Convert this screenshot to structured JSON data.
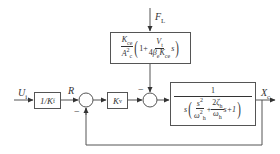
{
  "diagram": {
    "type": "control-block-diagram",
    "inputs": {
      "reference_input": {
        "symbol": "U",
        "subscript": "i"
      },
      "disturbance": {
        "symbol": "F",
        "subscript": "L"
      }
    },
    "signals": {
      "reference": "R",
      "output": {
        "symbol": "X",
        "subscript": "c"
      }
    },
    "blocks": {
      "feedback_gain": {
        "text": "1/K",
        "subscript": "f"
      },
      "valve_gain": {
        "symbol": "K",
        "subscript": "v"
      },
      "disturbance_tf": {
        "coef_num": {
          "symbol": "K",
          "subscript": "ce"
        },
        "coef_den": {
          "symbol": "A",
          "subscript": "c",
          "superscript": "2"
        },
        "one": "1",
        "plus": "+",
        "inner_num": {
          "symbol": "V",
          "subscript": "t"
        },
        "inner_den": {
          "prefix": "4",
          "beta": "β",
          "beta_sub": "e",
          "k": "K",
          "k_sub": "ce"
        },
        "s": "s"
      },
      "plant_tf": {
        "numerator": "1",
        "s": "s",
        "term1_num": {
          "symbol": "s",
          "superscript": "2"
        },
        "term1_den": {
          "symbol": "ω",
          "subscript": "h",
          "superscript": "2"
        },
        "plus": "+",
        "term2_num": {
          "prefix": "2",
          "symbol": "ζ",
          "subscript": "h"
        },
        "term2_den": {
          "symbol": "ω",
          "subscript": "h"
        },
        "tail": "s+1"
      }
    },
    "summing_junctions": [
      {
        "id": "sum1",
        "sign_feedback": "−"
      },
      {
        "id": "sum2",
        "sign_disturbance": "−"
      }
    ],
    "colors": {
      "line": "#555555",
      "text": "#333333",
      "background": "#ffffff"
    }
  }
}
